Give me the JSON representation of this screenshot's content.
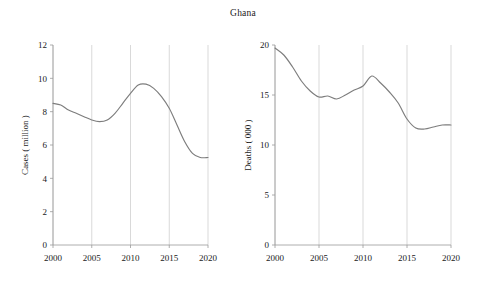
{
  "figure": {
    "title": "Ghana"
  },
  "chart_data": [
    {
      "type": "line",
      "panel": "left",
      "title": "Ghana",
      "xlabel": "",
      "ylabel": "Cases ( million )",
      "xlim": [
        2000,
        2020
      ],
      "ylim": [
        0,
        12
      ],
      "xticks": [
        2000,
        2005,
        2010,
        2015,
        2020
      ],
      "xticklabels": [
        "2000",
        "2005",
        "2010",
        "2015",
        "2020"
      ],
      "yticks": [
        0,
        2,
        4,
        6,
        8,
        10,
        12
      ],
      "yticklabels": [
        "0",
        "2",
        "4",
        "6",
        "8",
        "10",
        "12"
      ],
      "grid": "vertical",
      "legend": "none",
      "series": [
        {
          "name": "Cases",
          "x": [
            2000,
            2001,
            2002,
            2003,
            2004,
            2005,
            2006,
            2007,
            2008,
            2009,
            2010,
            2011,
            2012,
            2013,
            2014,
            2015,
            2016,
            2017,
            2018,
            2019,
            2020
          ],
          "values": [
            8.5,
            8.4,
            8.1,
            7.9,
            7.7,
            7.5,
            7.4,
            7.5,
            7.9,
            8.5,
            9.1,
            9.6,
            9.65,
            9.4,
            8.9,
            8.2,
            7.2,
            6.2,
            5.5,
            5.25,
            5.25
          ]
        }
      ]
    },
    {
      "type": "line",
      "panel": "right",
      "title": "Ghana",
      "xlabel": "",
      "ylabel": "Deaths ( 000 )",
      "xlim": [
        2000,
        2020
      ],
      "ylim": [
        0,
        20
      ],
      "xticks": [
        2000,
        2005,
        2010,
        2015,
        2020
      ],
      "xticklabels": [
        "2000",
        "2005",
        "2010",
        "2015",
        "2020"
      ],
      "yticks": [
        0,
        5,
        10,
        15,
        20
      ],
      "yticklabels": [
        "0",
        "5",
        "10",
        "15",
        "20"
      ],
      "grid": "vertical",
      "legend": "none",
      "series": [
        {
          "name": "Deaths",
          "x": [
            2000,
            2001,
            2002,
            2003,
            2004,
            2005,
            2006,
            2007,
            2008,
            2009,
            2010,
            2011,
            2012,
            2013,
            2014,
            2015,
            2016,
            2017,
            2018,
            2019,
            2020
          ],
          "values": [
            19.7,
            19.0,
            17.8,
            16.4,
            15.4,
            14.8,
            14.9,
            14.6,
            15.0,
            15.5,
            15.9,
            16.9,
            16.2,
            15.3,
            14.2,
            12.6,
            11.7,
            11.6,
            11.8,
            12.0,
            12.0
          ]
        }
      ]
    }
  ]
}
